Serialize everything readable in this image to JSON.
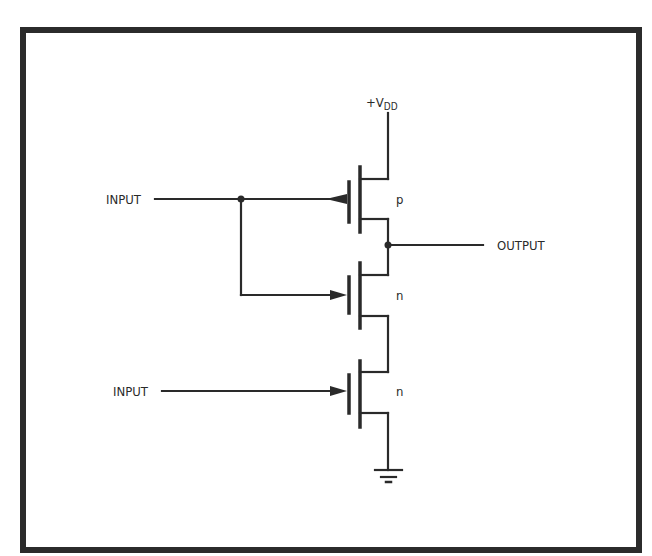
{
  "page": {
    "truncated_header_text": ""
  },
  "diagram": {
    "title": "",
    "supply_label": "+V",
    "supply_subscript": "DD",
    "inputs": [
      {
        "label": "INPUT"
      },
      {
        "label": "INPUT"
      }
    ],
    "output_label": "OUTPUT",
    "transistors": [
      {
        "type_label": "p"
      },
      {
        "type_label": "n"
      },
      {
        "type_label": "n"
      }
    ],
    "ground": "ground-symbol"
  }
}
